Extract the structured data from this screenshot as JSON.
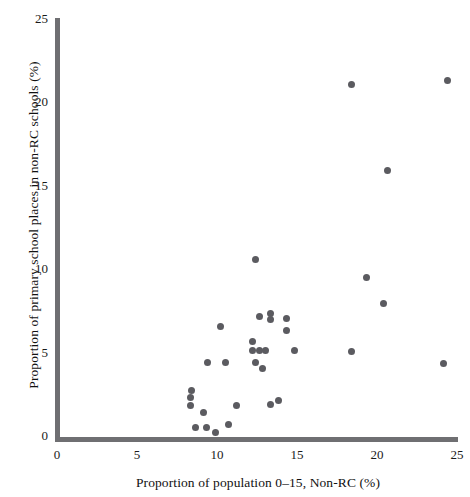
{
  "chart_data": {
    "type": "scatter",
    "title": "",
    "xlabel": "Proportion of population 0–15, Non-RC (%)",
    "ylabel": "Proportion of primary school places in non-RC schools (%)",
    "xlim": [
      0,
      25
    ],
    "ylim": [
      0,
      25
    ],
    "xticks": [
      0,
      5,
      10,
      15,
      20,
      25
    ],
    "yticks": [
      0,
      5,
      10,
      15,
      20,
      25
    ],
    "xtick_labels": [
      "0",
      "5",
      "10",
      "15",
      "20",
      "25"
    ],
    "ytick_labels": [
      "0",
      "5",
      "10",
      "15",
      "20",
      "25"
    ],
    "grid": false,
    "legend": false,
    "marker": "circle",
    "marker_color": "#5b5b60",
    "points": [
      {
        "x": 8.4,
        "y": 2.9
      },
      {
        "x": 8.3,
        "y": 2.5
      },
      {
        "x": 8.3,
        "y": 2.0
      },
      {
        "x": 9.1,
        "y": 1.6
      },
      {
        "x": 8.6,
        "y": 0.7
      },
      {
        "x": 9.3,
        "y": 0.7
      },
      {
        "x": 9.9,
        "y": 0.4
      },
      {
        "x": 10.7,
        "y": 0.9
      },
      {
        "x": 10.2,
        "y": 6.7
      },
      {
        "x": 9.4,
        "y": 4.6
      },
      {
        "x": 10.5,
        "y": 4.6
      },
      {
        "x": 11.2,
        "y": 2.0
      },
      {
        "x": 12.4,
        "y": 10.7
      },
      {
        "x": 12.6,
        "y": 7.3
      },
      {
        "x": 13.3,
        "y": 7.5
      },
      {
        "x": 13.3,
        "y": 7.1
      },
      {
        "x": 14.3,
        "y": 7.2
      },
      {
        "x": 14.3,
        "y": 6.5
      },
      {
        "x": 12.2,
        "y": 5.8
      },
      {
        "x": 12.2,
        "y": 5.3
      },
      {
        "x": 12.6,
        "y": 5.3
      },
      {
        "x": 13.0,
        "y": 5.3
      },
      {
        "x": 12.4,
        "y": 4.6
      },
      {
        "x": 12.8,
        "y": 4.2
      },
      {
        "x": 14.8,
        "y": 5.3
      },
      {
        "x": 13.3,
        "y": 2.1
      },
      {
        "x": 13.8,
        "y": 2.3
      },
      {
        "x": 18.4,
        "y": 21.1
      },
      {
        "x": 24.4,
        "y": 21.3
      },
      {
        "x": 20.6,
        "y": 16.0
      },
      {
        "x": 19.3,
        "y": 9.6
      },
      {
        "x": 20.4,
        "y": 8.1
      },
      {
        "x": 18.4,
        "y": 5.2
      },
      {
        "x": 24.1,
        "y": 4.5
      }
    ]
  },
  "axes": {
    "y_title": "Proportion of primary school places in non-RC schools (%)",
    "x_title": "Proportion of population 0–15, Non-RC (%)"
  }
}
